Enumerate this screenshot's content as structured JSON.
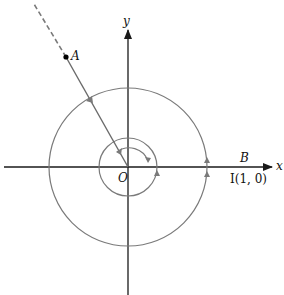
{
  "diagram": {
    "type": "unit-circle angle winding",
    "colors": {
      "axis": "#1a1a1a",
      "circle": "#7a7a7a",
      "ray": "#6a6a6a",
      "arrow": "#7a7a7a",
      "point": "#000000",
      "background": "#ffffff"
    },
    "origin": {
      "x": 128,
      "y": 167
    },
    "labels": {
      "x_axis": "x",
      "y_axis": "y",
      "origin": "O",
      "point_A": "A",
      "point_B": "B",
      "point_I": "I(1, 0)"
    },
    "circles": [
      {
        "name": "large-circle",
        "radius": 79
      },
      {
        "name": "small-circle",
        "radius": 29
      }
    ],
    "ray": {
      "from": "O",
      "through": "A",
      "solid_to": {
        "x": 66,
        "y": 57
      },
      "dashed_to": {
        "x": 34,
        "y": 4
      }
    }
  }
}
